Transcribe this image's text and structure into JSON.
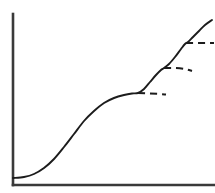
{
  "figure": {
    "background_color": "#ffffff",
    "width": 215,
    "height": 193
  },
  "chart_data": {
    "type": "line",
    "title": "",
    "subtitle": "",
    "xlabel": "",
    "ylabel": "",
    "xlim": [
      0,
      100
    ],
    "ylim": [
      0,
      100
    ],
    "grid": false,
    "legend": false,
    "legend_position": "none",
    "tick_labels": {
      "x": [],
      "y": []
    },
    "annotations": [],
    "axes": {
      "line_color": "#3a3a3a",
      "line_width": 2.6,
      "origin_px": [
        13,
        185
      ],
      "y_axis_top_px": [
        13,
        14
      ],
      "x_axis_right_px": [
        215,
        185
      ]
    },
    "series": [
      {
        "name": "composite-growth-curve",
        "style": "solid",
        "color": "#1c1c1c",
        "line_width": 1.9,
        "points_px": [
          [
            13,
            178
          ],
          [
            24,
            177
          ],
          [
            34,
            174
          ],
          [
            44,
            168
          ],
          [
            54,
            159
          ],
          [
            64,
            147
          ],
          [
            74,
            134
          ],
          [
            84,
            121
          ],
          [
            94,
            111
          ],
          [
            104,
            103
          ],
          [
            114,
            98
          ],
          [
            124,
            95
          ],
          [
            132,
            93.5
          ],
          [
            138,
            93
          ],
          [
            144,
            89
          ],
          [
            150,
            82
          ],
          [
            156,
            75
          ],
          [
            161,
            70
          ],
          [
            164,
            68
          ],
          [
            169,
            64
          ],
          [
            175,
            57
          ],
          [
            181,
            49
          ],
          [
            185,
            44
          ],
          [
            188,
            42
          ],
          [
            193,
            37
          ],
          [
            199,
            31
          ],
          [
            205,
            25
          ],
          [
            212,
            20
          ]
        ]
      },
      {
        "name": "plateau-1",
        "style": "dashed",
        "color": "#1c1c1c",
        "line_width": 2.0,
        "dash_pattern": "7 5",
        "points_px": [
          [
            138,
            93
          ],
          [
            150,
            93.5
          ],
          [
            160,
            94
          ],
          [
            166,
            94.5
          ]
        ]
      },
      {
        "name": "plateau-2",
        "style": "dashed",
        "color": "#1c1c1c",
        "line_width": 2.0,
        "dash_pattern": "7 5",
        "points_px": [
          [
            164,
            68
          ],
          [
            176,
            68
          ],
          [
            185,
            69
          ],
          [
            192,
            71
          ]
        ]
      },
      {
        "name": "plateau-3",
        "style": "dashed",
        "color": "#1c1c1c",
        "line_width": 2.0,
        "dash_pattern": "7 5",
        "points_px": [
          [
            186,
            43
          ],
          [
            196,
            43
          ],
          [
            206,
            43
          ],
          [
            214,
            43
          ]
        ]
      }
    ]
  }
}
